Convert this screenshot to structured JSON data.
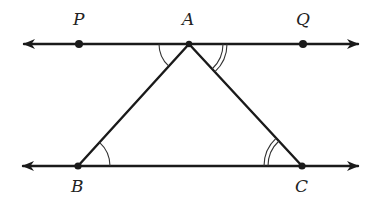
{
  "diagram": {
    "type": "geometry",
    "colors": {
      "stroke": "#1a1a1a",
      "text": "#222222",
      "background": "#ffffff"
    },
    "points": {
      "P": {
        "label": "P",
        "x": 79,
        "y": 44,
        "label_x": 73,
        "label_y": 25
      },
      "A": {
        "label": "A",
        "x": 189,
        "y": 44,
        "label_x": 182,
        "label_y": 25
      },
      "Q": {
        "label": "Q",
        "x": 303,
        "y": 44,
        "label_x": 296,
        "label_y": 25
      },
      "B": {
        "label": "B",
        "x": 78,
        "y": 166,
        "label_x": 71,
        "label_y": 192
      },
      "C": {
        "label": "C",
        "x": 302,
        "y": 166,
        "label_x": 295,
        "label_y": 192
      }
    },
    "lines": [
      {
        "name": "line-PQ",
        "x1": 24,
        "y1": 44,
        "x2": 358,
        "y2": 44,
        "arrows": "both"
      },
      {
        "name": "line-BC",
        "x1": 23,
        "y1": 166,
        "x2": 358,
        "y2": 166,
        "arrows": "both"
      },
      {
        "name": "segment-AB",
        "from": "A",
        "to": "B"
      },
      {
        "name": "segment-AC",
        "from": "A",
        "to": "C"
      }
    ],
    "angle_marks": [
      {
        "vertex": "A",
        "between": [
          "P",
          "B"
        ],
        "arcs": 1
      },
      {
        "vertex": "A",
        "between": [
          "Q",
          "C"
        ],
        "arcs": 2
      },
      {
        "vertex": "B",
        "between": [
          "A",
          "C"
        ],
        "arcs": 1
      },
      {
        "vertex": "C",
        "between": [
          "A",
          "B"
        ],
        "arcs": 2
      }
    ]
  }
}
